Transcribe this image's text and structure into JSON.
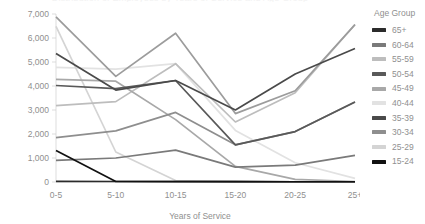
{
  "chart_data": {
    "type": "line",
    "title": "Distribution of Employees by Years of Service and Age Group",
    "xlabel": "Years of Service",
    "ylabel": "",
    "categories": [
      "0-5",
      "5-10",
      "10-15",
      "15-20",
      "20-25",
      "25+"
    ],
    "ylim": [
      0,
      7000
    ],
    "y_ticks": [
      0,
      1000,
      2000,
      3000,
      4000,
      5000,
      6000,
      7000
    ],
    "y_tick_labels": [
      "0",
      "1,000",
      "2,000",
      "3,000",
      "4,000",
      "5,000",
      "6,000",
      "7,000"
    ],
    "grid": false,
    "legend_position": "right",
    "legend_title": "Age Group",
    "series": [
      {
        "name": "65+",
        "color": "#2b2b2b",
        "values": [
          30,
          20,
          20,
          15,
          10,
          10
        ]
      },
      {
        "name": "60-64",
        "color": "#7a7a7a",
        "values": [
          900,
          1000,
          1330,
          620,
          700,
          1110
        ]
      },
      {
        "name": "55-59",
        "color": "#bdbdbd",
        "values": [
          3180,
          3350,
          4930,
          2500,
          3720,
          6560
        ]
      },
      {
        "name": "50-54",
        "color": "#595959",
        "values": [
          4020,
          3890,
          4230,
          1550,
          2100,
          3330
        ]
      },
      {
        "name": "45-49",
        "color": "#a8a8a8",
        "values": [
          4280,
          4200,
          2600,
          650,
          110,
          20
        ]
      },
      {
        "name": "40-44",
        "color": "#e2e2e2",
        "values": [
          4780,
          4700,
          4930,
          2150,
          800,
          150
        ]
      },
      {
        "name": "35-39",
        "color": "#4a4a4a",
        "values": [
          5350,
          3830,
          4230,
          3000,
          4500,
          5560
        ]
      },
      {
        "name": "30-34",
        "color": "#8e8e8e",
        "values": [
          1850,
          2130,
          2900,
          1550,
          2100,
          3330
        ]
      },
      {
        "name": "25-29",
        "color": "#d4d4d4",
        "values": [
          6480,
          1250,
          60,
          20,
          10,
          10
        ]
      },
      {
        "name": "15-24",
        "color": "#111111",
        "values": [
          1310,
          20,
          15,
          15,
          10,
          10
        ]
      },
      {
        "name": "20-24",
        "color": "#9c9c9c",
        "values": [
          6880,
          4400,
          6200,
          2850,
          3800,
          6560
        ]
      }
    ]
  },
  "legend": {
    "title": "Age Group",
    "items": [
      {
        "label": "65+",
        "color": "#2b2b2b"
      },
      {
        "label": "60-64",
        "color": "#7a7a7a"
      },
      {
        "label": "55-59",
        "color": "#bdbdbd"
      },
      {
        "label": "50-54",
        "color": "#595959"
      },
      {
        "label": "45-49",
        "color": "#a8a8a8"
      },
      {
        "label": "40-44",
        "color": "#e2e2e2"
      },
      {
        "label": "35-39",
        "color": "#4a4a4a"
      },
      {
        "label": "30-34",
        "color": "#8e8e8e"
      },
      {
        "label": "25-29",
        "color": "#d4d4d4"
      },
      {
        "label": "15-24",
        "color": "#111111"
      }
    ]
  }
}
